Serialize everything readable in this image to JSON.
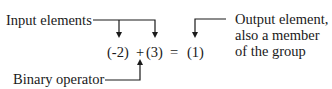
{
  "labels": {
    "inputs": "Input elements",
    "operator": "Binary operator",
    "output_line1": "Output element,",
    "output_line2": "also a member",
    "output_line3": "of the group"
  },
  "equation": {
    "operand1": "(-2)",
    "operator": "+",
    "operand2": "(3)",
    "equals": "=",
    "result": "(1)"
  }
}
